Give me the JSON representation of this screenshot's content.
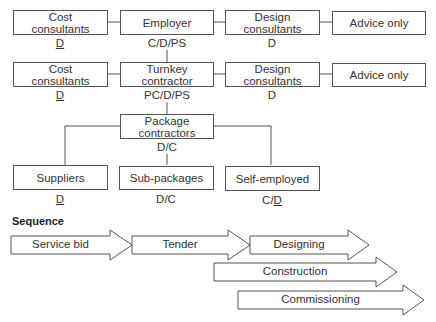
{
  "row1": {
    "cost": {
      "title": [
        "Cost",
        "consultants"
      ],
      "role": "D",
      "role_underlined": true
    },
    "employer": {
      "title": [
        "Employer"
      ],
      "role": "C/D/PS"
    },
    "design": {
      "title": [
        "Design",
        "consultants"
      ],
      "role": "D"
    },
    "advice": {
      "title": [
        "Advice only"
      ]
    }
  },
  "row2": {
    "cost": {
      "title": [
        "Cost",
        "consultants"
      ],
      "role": "D",
      "role_underlined": true
    },
    "turnkey": {
      "title": [
        "Turnkey",
        "contractor"
      ],
      "role": "PC/D/PS"
    },
    "design": {
      "title": [
        "Design",
        "consultants"
      ],
      "role": "D"
    },
    "advice": {
      "title": [
        "Advice only"
      ]
    }
  },
  "package": {
    "title": [
      "Package",
      "contractors"
    ],
    "role": "D/C"
  },
  "row3": {
    "suppliers": {
      "title": [
        "Suppliers"
      ],
      "role": "D",
      "role_underlined": true
    },
    "subpackages": {
      "title": [
        "Sub-packages"
      ],
      "role": "D/C"
    },
    "selfemployed": {
      "title": [
        "Self-employed"
      ],
      "role_prefix": "C/",
      "role_underlined_part": "D"
    }
  },
  "sequence": {
    "title": "Sequence",
    "arrows": [
      {
        "label": "Service bid"
      },
      {
        "label": "Tender"
      },
      {
        "label": "Designing"
      },
      {
        "label": "Construction"
      },
      {
        "label": "Commissioning"
      }
    ]
  },
  "colors": {
    "stroke": "#555555",
    "text": "#333333",
    "background": "#ffffff"
  }
}
